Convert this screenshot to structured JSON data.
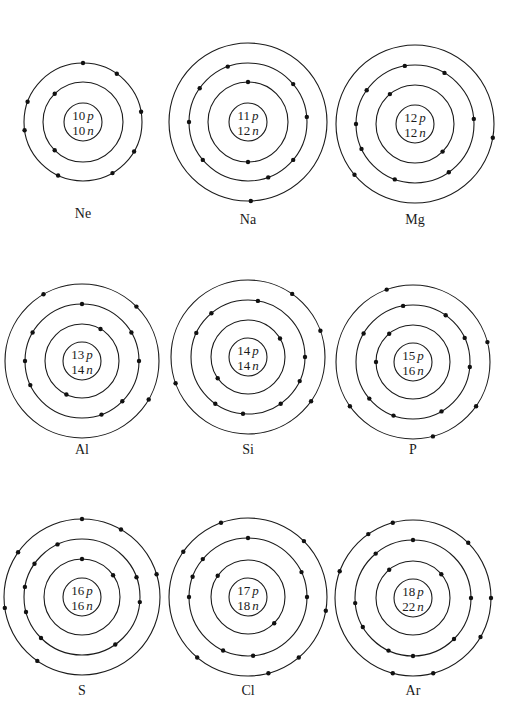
{
  "figure": {
    "type": "bohr-model-diagrams",
    "atoms": [
      {
        "symbol": "Ne",
        "protons": "10",
        "neutrons": "10",
        "p_label": "p",
        "n_label": "n",
        "center": [
          83,
          122
        ],
        "nucleus_r": 19,
        "label_y": 218,
        "shells": [
          {
            "r": 40,
            "electrons": 2,
            "angles": [
              -135,
              135
            ]
          },
          {
            "r": 59,
            "electrons": 8,
            "angles": [
              -90,
              -55,
              -10,
              30,
              60,
              115,
              172,
              -160
            ]
          }
        ]
      },
      {
        "symbol": "Na",
        "protons": "11",
        "neutrons": "12",
        "p_label": "p",
        "n_label": "n",
        "center": [
          248,
          122
        ],
        "nucleus_r": 19,
        "label_y": 224,
        "shells": [
          {
            "r": 40,
            "electrons": 2,
            "angles": [
              -90,
              90
            ]
          },
          {
            "r": 59,
            "electrons": 8,
            "angles": [
              -110,
              -40,
              -5,
              40,
              70,
              140,
              180,
              -145
            ]
          },
          {
            "r": 79,
            "electrons": 1,
            "angles": [
              88
            ]
          }
        ]
      },
      {
        "symbol": "Mg",
        "protons": "12",
        "neutrons": "12",
        "p_label": "p",
        "n_label": "n",
        "center": [
          415,
          124
        ],
        "nucleus_r": 19,
        "label_y": 224,
        "shells": [
          {
            "r": 39,
            "electrons": 2,
            "angles": [
              -130,
              45
            ]
          },
          {
            "r": 59,
            "electrons": 8,
            "angles": [
              -100,
              -60,
              -5,
              55,
              110,
              155,
              180,
              -145
            ]
          },
          {
            "r": 79,
            "electrons": 2,
            "angles": [
              10,
              140
            ]
          }
        ]
      },
      {
        "symbol": "Al",
        "protons": "13",
        "neutrons": "14",
        "p_label": "p",
        "n_label": "n",
        "center": [
          82,
          361
        ],
        "nucleus_r": 19,
        "label_y": 454,
        "shells": [
          {
            "r": 37,
            "electrons": 2,
            "angles": [
              -60,
              115
            ]
          },
          {
            "r": 57,
            "electrons": 8,
            "angles": [
              -90,
              -30,
              0,
              45,
              70,
              155,
              180,
              -150
            ]
          },
          {
            "r": 77,
            "electrons": 3,
            "angles": [
              -120,
              -45,
              30
            ]
          }
        ]
      },
      {
        "symbol": "Si",
        "protons": "14",
        "neutrons": "14",
        "p_label": "p",
        "n_label": "n",
        "center": [
          248,
          357
        ],
        "nucleus_r": 19,
        "label_y": 454,
        "shells": [
          {
            "r": 37,
            "electrons": 2,
            "angles": [
              -30,
              145
            ]
          },
          {
            "r": 57,
            "electrons": 8,
            "angles": [
              -80,
              -130,
              -155,
              0,
              25,
              55,
              95,
              125
            ]
          },
          {
            "r": 77,
            "electrons": 4,
            "angles": [
              -55,
              -20,
              35,
              160
            ]
          }
        ]
      },
      {
        "symbol": "P",
        "protons": "15",
        "neutrons": "16",
        "p_label": "p",
        "n_label": "n",
        "center": [
          413,
          362
        ],
        "nucleus_r": 19,
        "label_y": 454,
        "shells": [
          {
            "r": 37,
            "electrons": 2,
            "angles": [
              -130,
              180
            ]
          },
          {
            "r": 57,
            "electrons": 8,
            "angles": [
              -100,
              -55,
              -25,
              5,
              60,
              110,
              140,
              -150
            ]
          },
          {
            "r": 77,
            "electrons": 5,
            "angles": [
              -110,
              -15,
              35,
              75,
              145
            ]
          }
        ]
      },
      {
        "symbol": "S",
        "protons": "16",
        "neutrons": "16",
        "p_label": "p",
        "n_label": "n",
        "center": [
          82,
          597
        ],
        "nucleus_r": 19,
        "label_y": 695,
        "shells": [
          {
            "r": 38,
            "electrons": 2,
            "angles": [
              -90,
              -35
            ]
          },
          {
            "r": 58,
            "electrons": 8,
            "angles": [
              -115,
              -145,
              -170,
              165,
              135,
              55,
              5,
              -20
            ]
          },
          {
            "r": 78,
            "electrons": 6,
            "angles": [
              -90,
              -60,
              -17,
              125,
              172,
              -145
            ]
          }
        ]
      },
      {
        "symbol": "Cl",
        "protons": "17",
        "neutrons": "18",
        "p_label": "p",
        "n_label": "n",
        "center": [
          248,
          597
        ],
        "nucleus_r": 19,
        "label_y": 695,
        "shells": [
          {
            "r": 37,
            "electrons": 2,
            "angles": [
              -145,
              45
            ]
          },
          {
            "r": 59,
            "electrons": 8,
            "angles": [
              -90,
              -140,
              -160,
              180,
              0,
              -25,
              115,
              85
            ]
          },
          {
            "r": 79,
            "electrons": 7,
            "angles": [
              -110,
              -145,
              -45,
              10,
              50,
              75,
              130
            ]
          }
        ]
      },
      {
        "symbol": "Ar",
        "protons": "18",
        "neutrons": "22",
        "p_label": "p",
        "n_label": "n",
        "center": [
          413,
          598
        ],
        "nucleus_r": 19,
        "label_y": 695,
        "shells": [
          {
            "r": 37,
            "electrons": 2,
            "angles": [
              -130,
              -40
            ]
          },
          {
            "r": 58,
            "electrons": 8,
            "angles": [
              -90,
              -130,
              175,
              150,
              115,
              90,
              45,
              0
            ]
          },
          {
            "r": 78,
            "electrons": 8,
            "angles": [
              -105,
              -125,
              -160,
              -45,
              0,
              30,
              75,
              105
            ]
          }
        ]
      }
    ]
  }
}
